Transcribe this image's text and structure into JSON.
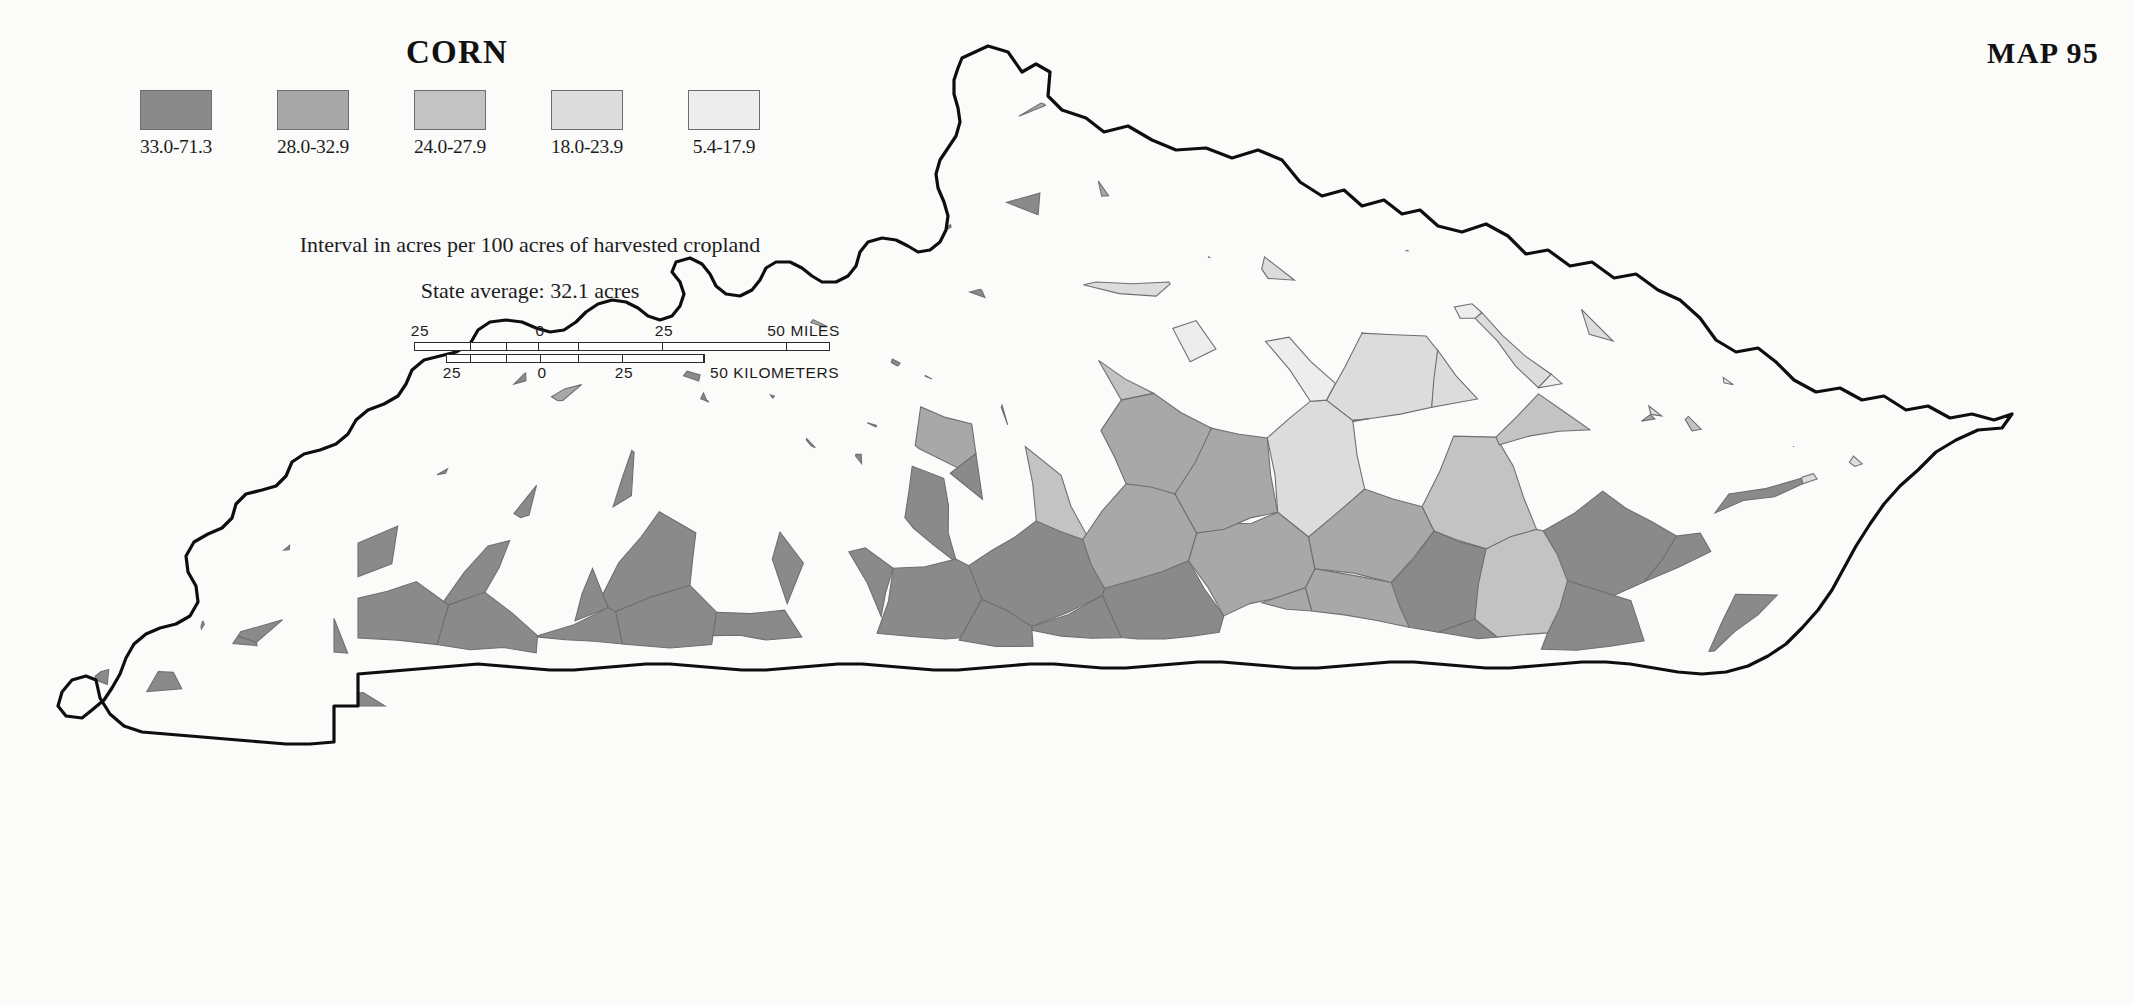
{
  "title": "CORN",
  "map_number": "MAP 95",
  "legend": {
    "items": [
      {
        "range": "33.0-71.3",
        "color": "#8a8a8a"
      },
      {
        "range": "28.0-32.9",
        "color": "#a8a8a8"
      },
      {
        "range": "24.0-27.9",
        "color": "#c3c3c3"
      },
      {
        "range": "18.0-23.9",
        "color": "#dcdcdc"
      },
      {
        "range": "5.4-17.9",
        "color": "#ededed"
      }
    ],
    "interval_note": "Interval in acres per 100 acres of harvested cropland",
    "state_average_note": "State average: 32.1 acres"
  },
  "scalebar": {
    "miles": {
      "ticks": [
        "25",
        "0",
        "25"
      ],
      "unit_label": "50 MILES"
    },
    "kilometers": {
      "ticks": [
        "25",
        "0",
        "25"
      ],
      "unit_label": "50 KILOMETERS"
    }
  },
  "chart_data": {
    "type": "map",
    "subtype": "choropleth",
    "title": "CORN",
    "region": "Kentucky",
    "unit": "acres per 100 acres of harvested cropland",
    "state_average": 32.1,
    "classes": [
      {
        "label": "33.0-71.3",
        "min": 33.0,
        "max": 71.3,
        "color": "#8a8a8a"
      },
      {
        "label": "28.0-32.9",
        "min": 28.0,
        "max": 32.9,
        "color": "#a8a8a8"
      },
      {
        "label": "24.0-27.9",
        "min": 24.0,
        "max": 27.9,
        "color": "#c3c3c3"
      },
      {
        "label": "18.0-23.9",
        "min": 18.0,
        "max": 23.9,
        "color": "#dcdcdc"
      },
      {
        "label": "5.4-17.9",
        "min": 5.4,
        "max": 17.9,
        "color": "#ededed"
      }
    ],
    "value_range": [
      5.4,
      71.3
    ],
    "legend_position": "top-left",
    "scale_miles_max": 50,
    "scale_km_max": 50
  }
}
